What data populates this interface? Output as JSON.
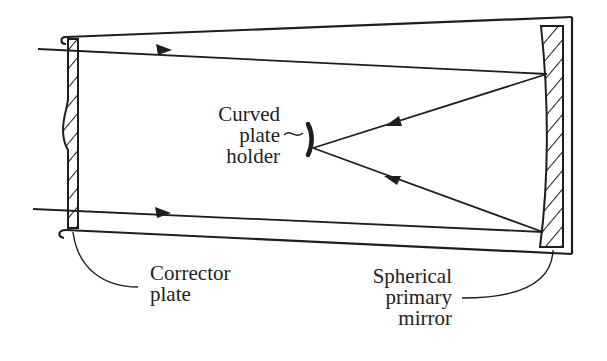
{
  "diagram": {
    "colors": {
      "line": "#1e1e1e",
      "background": "#ffffff"
    },
    "components": [
      {
        "id": "tube",
        "label": "Telescope tube"
      },
      {
        "id": "corrector",
        "label": "Corrector plate"
      },
      {
        "id": "mirror",
        "label": "Spherical primary mirror"
      },
      {
        "id": "plate_holder",
        "label": "Curved plate holder"
      }
    ],
    "rays": [
      {
        "id": "upper",
        "from": "incoming light",
        "to": "mirror",
        "then": "plate_holder"
      },
      {
        "id": "lower",
        "from": "incoming light",
        "to": "mirror",
        "then": "plate_holder"
      }
    ]
  },
  "labels": {
    "plate_holder": [
      "Curved",
      "plate",
      "holder"
    ],
    "corrector": [
      "Corrector",
      "plate"
    ],
    "mirror": [
      "Spherical",
      "primary",
      "mirror"
    ]
  }
}
